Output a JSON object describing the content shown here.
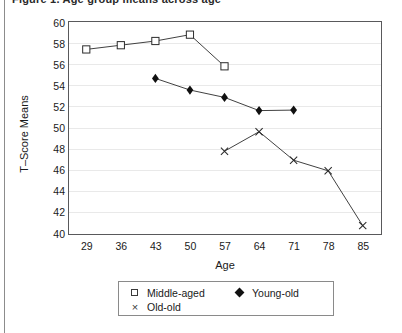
{
  "figure": {
    "title_fragment": "Figure 1.  Age group means across age",
    "axis_title_y": "T–Score Means",
    "axis_title_x": "Age"
  },
  "legend": {
    "items": [
      {
        "label": "Middle-aged",
        "marker": "open-square-icon",
        "color": "#111111"
      },
      {
        "label": "Young-old",
        "marker": "filled-diamond-icon",
        "color": "#111111"
      },
      {
        "label": "Old-old",
        "marker": "x-cross-icon",
        "color": "#3a3a3a"
      }
    ]
  },
  "chart_data": {
    "type": "line",
    "title": "",
    "xlabel": "Age",
    "ylabel": "T–Score Means",
    "x": [
      29,
      36,
      43,
      50,
      57,
      64,
      71,
      78,
      85
    ],
    "xticklabels": [
      "29",
      "36",
      "43",
      "50",
      "57",
      "64",
      "71",
      "78",
      "85"
    ],
    "xlim": [
      25.5,
      88.5
    ],
    "ylim": [
      40,
      60
    ],
    "yticks": [
      40,
      42,
      44,
      46,
      48,
      50,
      52,
      54,
      56,
      58,
      60
    ],
    "yticklabels": [
      "40",
      "42",
      "44",
      "46",
      "48",
      "50",
      "52",
      "54",
      "56",
      "58",
      "60"
    ],
    "grid": "horizontal",
    "legend_position": "below-axes",
    "series": [
      {
        "name": "Middle-aged",
        "marker": "open-square",
        "points": [
          {
            "x": 29,
            "y": 57.4
          },
          {
            "x": 36,
            "y": 57.8
          },
          {
            "x": 43,
            "y": 58.2
          },
          {
            "x": 50,
            "y": 58.8
          },
          {
            "x": 57,
            "y": 55.8
          }
        ]
      },
      {
        "name": "Young-old",
        "marker": "filled-diamond",
        "points": [
          {
            "x": 43,
            "y": 54.65
          },
          {
            "x": 50,
            "y": 53.55
          },
          {
            "x": 57,
            "y": 52.85
          },
          {
            "x": 64,
            "y": 51.6
          },
          {
            "x": 71,
            "y": 51.65
          }
        ]
      },
      {
        "name": "Old-old",
        "marker": "x-cross",
        "points": [
          {
            "x": 57,
            "y": 47.75
          },
          {
            "x": 64,
            "y": 49.6
          },
          {
            "x": 71,
            "y": 46.9
          },
          {
            "x": 78,
            "y": 45.9
          },
          {
            "x": 85,
            "y": 40.7
          }
        ]
      }
    ]
  }
}
